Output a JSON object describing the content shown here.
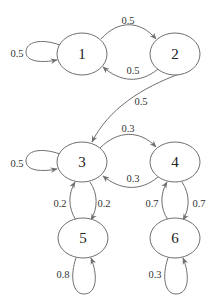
{
  "diagram": {
    "type": "markov-chain-state-diagram",
    "nodes": [
      {
        "id": "1",
        "label": "1",
        "cx": 82,
        "cy": 54
      },
      {
        "id": "2",
        "label": "2",
        "cx": 175,
        "cy": 54
      },
      {
        "id": "3",
        "label": "3",
        "cx": 82,
        "cy": 162
      },
      {
        "id": "4",
        "label": "4",
        "cx": 175,
        "cy": 162
      },
      {
        "id": "5",
        "label": "5",
        "cx": 83,
        "cy": 238
      },
      {
        "id": "6",
        "label": "6",
        "cx": 175,
        "cy": 238
      }
    ],
    "edges": [
      {
        "from": "1",
        "to": "1",
        "label": "0.5"
      },
      {
        "from": "1",
        "to": "2",
        "label": "0.5"
      },
      {
        "from": "2",
        "to": "1",
        "label": "0.5"
      },
      {
        "from": "2",
        "to": "3",
        "label": "0.5"
      },
      {
        "from": "3",
        "to": "3",
        "label": "0.5"
      },
      {
        "from": "3",
        "to": "4",
        "label": "0.3"
      },
      {
        "from": "4",
        "to": "3",
        "label": "0.3"
      },
      {
        "from": "5",
        "to": "3",
        "label": "0.2"
      },
      {
        "from": "3",
        "to": "5",
        "label": "0.2"
      },
      {
        "from": "6",
        "to": "4",
        "label": "0.7"
      },
      {
        "from": "4",
        "to": "6",
        "label": "0.7"
      },
      {
        "from": "5",
        "to": "5",
        "label": "0.8"
      },
      {
        "from": "6",
        "to": "6",
        "label": "0.3"
      }
    ],
    "colors": {
      "stroke": "#6f6f6f",
      "text": "#222222",
      "background": "#ffffff"
    }
  }
}
